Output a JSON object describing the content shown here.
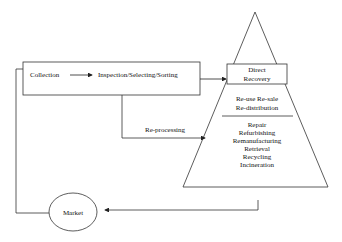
{
  "diagram": {
    "type": "reverse-logistics-flow",
    "nodes": {
      "collection": "Collection",
      "inspection": "Inspection/Selecting/Sorting",
      "reprocessing": "Re-processing",
      "market": "Market",
      "pyramid": {
        "top": [
          "Direct",
          "Recovery"
        ],
        "middle": [
          "Re-use Re-sale",
          "Re-distribution"
        ],
        "bottom": [
          "Repair",
          "Refurbishing",
          "Remanufacturing",
          "Retrieval",
          "Recycling",
          "Incineration"
        ]
      }
    },
    "edges": [
      {
        "from": "Collection",
        "to": "Inspection/Selecting/Sorting"
      },
      {
        "from": "Inspection/Selecting/Sorting",
        "to": "Direct Recovery"
      },
      {
        "from": "Inspection/Selecting/Sorting",
        "to": "Re-processing",
        "label": "Re-processing"
      },
      {
        "from": "Recovery pyramid",
        "to": "Market"
      },
      {
        "from": "Market",
        "to": "Collection"
      }
    ],
    "colors": {
      "line": "#222222",
      "background": "#ffffff"
    }
  }
}
